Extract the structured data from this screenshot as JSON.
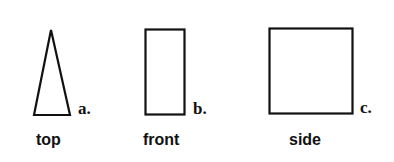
{
  "figure": {
    "views": [
      {
        "id": "a",
        "letter": "a.",
        "label": "top",
        "shape": "triangle"
      },
      {
        "id": "b",
        "letter": "b.",
        "label": "front",
        "shape": "tall-rectangle"
      },
      {
        "id": "c",
        "letter": "c.",
        "label": "side",
        "shape": "square"
      }
    ]
  },
  "colors": {
    "stroke": "#111111",
    "background": "#ffffff"
  }
}
